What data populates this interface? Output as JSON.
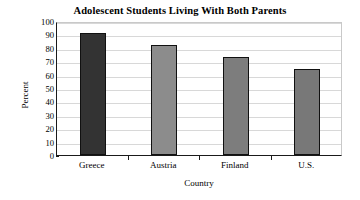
{
  "chart_data": {
    "type": "bar",
    "title": "Adolescent Students Living With Both Parents",
    "xlabel": "Country",
    "ylabel": "Percent",
    "categories": [
      "Greece",
      "Austria",
      "Finland",
      "U.S."
    ],
    "values": [
      91,
      82,
      73,
      64
    ],
    "ylim": [
      0,
      100
    ],
    "ytick_labels": [
      "0",
      "10",
      "20",
      "30",
      "40",
      "50",
      "60",
      "70",
      "80",
      "90",
      "100"
    ],
    "ytick_values": [
      0,
      10,
      20,
      30,
      40,
      50,
      60,
      70,
      80,
      90,
      100
    ],
    "grid": true,
    "legend": false,
    "bar_colors": [
      "#333333",
      "#8c8c8c",
      "#7d7d7d",
      "#787878"
    ],
    "bar_edge_color": "#111111",
    "background_color": "#ffffff",
    "gridline_color": "#d8d8d8",
    "axis_color": "#1a1a1a"
  }
}
